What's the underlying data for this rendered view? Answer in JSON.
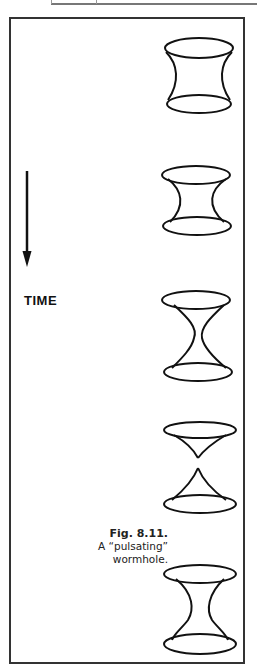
{
  "figure": {
    "axis_label": "TIME",
    "caption": {
      "number": "Fig. 8.11.",
      "line1": "A “pulsating”",
      "line2": "wormhole."
    },
    "arrow": {
      "direction": "down",
      "meaning": "time-flow"
    },
    "frames": [
      {
        "id": 1,
        "state": "wide-throat",
        "description": "wormhole with wide throat"
      },
      {
        "id": 2,
        "state": "narrowing-throat",
        "description": "wormhole with narrowing throat"
      },
      {
        "id": 3,
        "state": "narrow-throat",
        "description": "wormhole with very narrow throat"
      },
      {
        "id": 4,
        "state": "pinched-off",
        "description": "throat pinched off into two cones"
      },
      {
        "id": 5,
        "state": "reopened",
        "description": "wormhole reopened"
      }
    ]
  }
}
